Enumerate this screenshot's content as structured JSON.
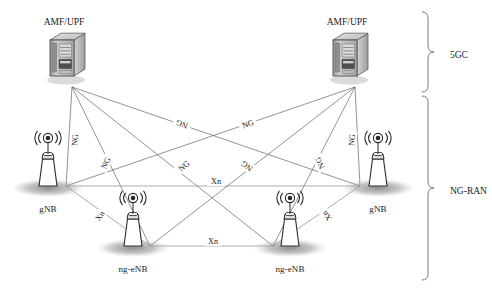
{
  "core_nodes": [
    {
      "id": "amf-upf-left",
      "label": "AMF/UPF",
      "x": 62,
      "y": 58,
      "anchor_x": 72,
      "anchor_y": 87,
      "label_x": 64,
      "label_y": 25
    },
    {
      "id": "amf-upf-right",
      "label": "AMF/UPF",
      "x": 345,
      "y": 58,
      "anchor_x": 355,
      "anchor_y": 87,
      "label_x": 347,
      "label_y": 25
    }
  ],
  "ran_nodes": [
    {
      "id": "gnb-left",
      "label": "gNB",
      "x": 48,
      "y": 186,
      "anchor_x": 66,
      "anchor_y": 186,
      "label_x": 48,
      "label_y": 212
    },
    {
      "id": "ng-enb-left",
      "label": "ng-eNB",
      "x": 133,
      "y": 246,
      "anchor_x": 150,
      "anchor_y": 246,
      "label_x": 133,
      "label_y": 272
    },
    {
      "id": "ng-enb-right",
      "label": "ng-eNB",
      "x": 290,
      "y": 246,
      "anchor_x": 273,
      "anchor_y": 246,
      "label_x": 290,
      "label_y": 272
    },
    {
      "id": "gnb-right",
      "label": "gNB",
      "x": 378,
      "y": 186,
      "anchor_x": 360,
      "anchor_y": 186,
      "label_x": 378,
      "label_y": 212
    }
  ],
  "ng_links": [
    {
      "id": "ng-amfL-gnbL",
      "label": "NG",
      "x1": 72,
      "y1": 87,
      "x2": 66,
      "y2": 186,
      "lx": 75,
      "ly": 140,
      "rot": -85
    },
    {
      "id": "ng-amfL-enbL",
      "label": "NG",
      "x1": 72,
      "y1": 87,
      "x2": 150,
      "y2": 246,
      "lx": 106,
      "ly": 163,
      "rot": -64
    },
    {
      "id": "ng-amfL-enbR",
      "label": "NG",
      "x1": 72,
      "y1": 87,
      "x2": 273,
      "y2": 246,
      "lx": 184,
      "ly": 166,
      "rot": -38
    },
    {
      "id": "ng-amfL-gnbR",
      "label": "NG",
      "x1": 72,
      "y1": 87,
      "x2": 360,
      "y2": 186,
      "lx": 248,
      "ly": 124,
      "rot": -19
    },
    {
      "id": "ng-amfR-gnbR",
      "label": "NG",
      "x1": 355,
      "y1": 87,
      "x2": 360,
      "y2": 186,
      "lx": 352,
      "ly": 140,
      "rot": -85
    },
    {
      "id": "ng-amfR-enbR",
      "label": "NG",
      "x1": 355,
      "y1": 87,
      "x2": 273,
      "y2": 246,
      "lx": 320,
      "ly": 163,
      "rot": -116
    },
    {
      "id": "ng-amfR-enbL",
      "label": "NG",
      "x1": 355,
      "y1": 87,
      "x2": 150,
      "y2": 246,
      "lx": 247,
      "ly": 166,
      "rot": -142
    },
    {
      "id": "ng-amfR-gnbL",
      "label": "NG",
      "x1": 355,
      "y1": 87,
      "x2": 66,
      "y2": 186,
      "lx": 182,
      "ly": 124,
      "rot": -161
    }
  ],
  "xn_links": [
    {
      "id": "xn-gnbL-gnbR",
      "label": "Xn",
      "x1": 66,
      "y1": 186,
      "x2": 360,
      "y2": 186,
      "lx": 216,
      "ly": 181,
      "rot": 0
    },
    {
      "id": "xn-enbL-enbR",
      "label": "Xn",
      "x1": 150,
      "y1": 246,
      "x2": 273,
      "y2": 246,
      "lx": 213,
      "ly": 241,
      "rot": 0
    },
    {
      "id": "xn-gnbL-enbL",
      "label": "Xn",
      "x1": 66,
      "y1": 186,
      "x2": 150,
      "y2": 246,
      "lx": 100,
      "ly": 216,
      "rot": -55
    },
    {
      "id": "xn-gnbR-enbR",
      "label": "Xn",
      "x1": 360,
      "y1": 186,
      "x2": 273,
      "y2": 246,
      "lx": 327,
      "ly": 216,
      "rot": -125
    }
  ],
  "groups": [
    {
      "id": "group-5gc",
      "label": "5GC",
      "top": 12,
      "bottom": 92,
      "label_x": 450,
      "label_y": 55
    },
    {
      "id": "group-ng-ran",
      "label": "NG-RAN",
      "top": 96,
      "bottom": 280,
      "label_x": 450,
      "label_y": 191
    }
  ],
  "colors": {
    "line": "#4a4a4a",
    "xn_line": "#8a8a8a",
    "text": "#1a1a1a",
    "bracket": "#6a6a6a",
    "shadow": "#9a9a9a",
    "server_light": "#d8d8d8",
    "server_mid": "#b0b0b0",
    "server_dark": "#8a8a8a"
  }
}
